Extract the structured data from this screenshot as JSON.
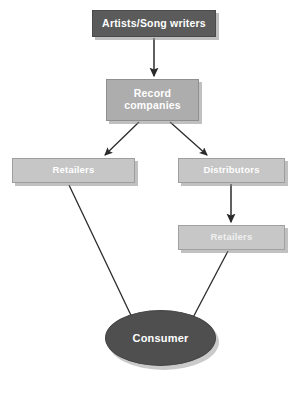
{
  "diagram": {
    "type": "flowchart",
    "background_color": "#ffffff",
    "nodes": [
      {
        "id": "artists",
        "label": "Artists/Song writers",
        "shape": "rectangle",
        "fill_color": "#5b5b5b",
        "text_color": "#ffffff"
      },
      {
        "id": "record_companies",
        "label": "Record companies",
        "label_line1": "Record",
        "label_line2": "companies",
        "shape": "rectangle",
        "fill_color": "#adadad",
        "text_color": "#ffffff"
      },
      {
        "id": "retailers_left",
        "label": "Retailers",
        "shape": "rectangle",
        "fill_color": "#c6c6c6",
        "text_color": "#ffffff"
      },
      {
        "id": "distributors",
        "label": "Distributors",
        "shape": "rectangle",
        "fill_color": "#c6c6c6",
        "text_color": "#ffffff"
      },
      {
        "id": "retailers_right",
        "label": "Retailers",
        "shape": "rectangle",
        "fill_color": "#c6c6c6",
        "text_color": "#f0f0f0"
      },
      {
        "id": "consumer",
        "label": "Consumer",
        "shape": "ellipse",
        "fill_color": "#4f4f4f",
        "text_color": "#ffffff"
      }
    ],
    "edges": [
      {
        "from": "artists",
        "to": "record_companies",
        "style": "straight-vertical"
      },
      {
        "from": "record_companies",
        "to": "retailers_left",
        "style": "diagonal-left"
      },
      {
        "from": "record_companies",
        "to": "distributors",
        "style": "diagonal-right"
      },
      {
        "from": "distributors",
        "to": "retailers_right",
        "style": "straight-vertical"
      },
      {
        "from": "retailers_left",
        "to": "consumer",
        "style": "diagonal-right"
      },
      {
        "from": "retailers_right",
        "to": "consumer",
        "style": "diagonal-left"
      }
    ],
    "edge_color": "#2b2b2b"
  }
}
